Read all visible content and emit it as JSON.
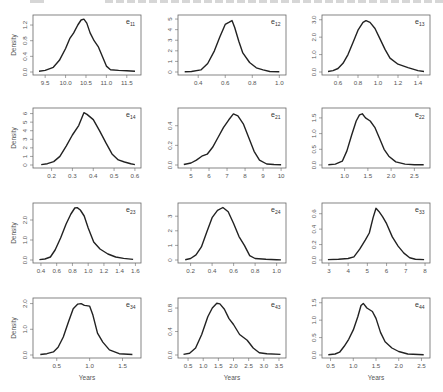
{
  "header": {
    "text_left": "",
    "text_right": ""
  },
  "chart_data": [
    {
      "id": "e11",
      "type": "line",
      "title": "e11",
      "subscript": "11",
      "xlabel": "",
      "ylabel": "Density",
      "xlim": [
        9.3,
        11.75
      ],
      "ylim": [
        0,
        1.38
      ],
      "xticks": [
        9.5,
        10.0,
        10.5,
        11.0,
        11.5
      ],
      "xtick_labels": [
        "9.5",
        "10.0",
        "10.5",
        "11.0",
        "11.5"
      ],
      "yticks": [
        0,
        0.4,
        0.8,
        1.2
      ],
      "ytick_labels": [
        "0.0",
        "0.4",
        "0.8",
        "1.2"
      ],
      "x": [
        9.35,
        9.5,
        9.7,
        9.85,
        10.0,
        10.1,
        10.2,
        10.3,
        10.38,
        10.45,
        10.52,
        10.6,
        10.7,
        10.8,
        10.9,
        11.0,
        11.1,
        11.3,
        11.5,
        11.7
      ],
      "y": [
        0.02,
        0.04,
        0.12,
        0.3,
        0.6,
        0.85,
        1.0,
        1.2,
        1.33,
        1.35,
        1.25,
        1.0,
        0.8,
        0.65,
        0.4,
        0.15,
        0.06,
        0.04,
        0.03,
        0.02
      ]
    },
    {
      "id": "e12",
      "type": "line",
      "title": "e12",
      "subscript": "12",
      "xlabel": "",
      "ylabel": "",
      "xlim": [
        0.28,
        1.02
      ],
      "ylim": [
        0,
        5.1
      ],
      "xticks": [
        0.4,
        0.6,
        0.8,
        1.0
      ],
      "xtick_labels": [
        "0.4",
        "0.6",
        "0.8",
        "1.0"
      ],
      "yticks": [
        0,
        1,
        2,
        3,
        4,
        5
      ],
      "ytick_labels": [
        "0",
        "1",
        "2",
        "3",
        "4",
        "5"
      ],
      "x": [
        0.3,
        0.35,
        0.42,
        0.47,
        0.52,
        0.56,
        0.6,
        0.63,
        0.65,
        0.67,
        0.7,
        0.73,
        0.78,
        0.83,
        0.88,
        0.93,
        1.0
      ],
      "y": [
        0.02,
        0.05,
        0.2,
        0.8,
        2.0,
        3.3,
        4.5,
        4.7,
        4.85,
        4.2,
        2.9,
        1.8,
        0.9,
        0.4,
        0.2,
        0.05,
        0.02
      ]
    },
    {
      "id": "e13",
      "type": "line",
      "title": "e13",
      "subscript": "13",
      "xlabel": "",
      "ylabel": "",
      "xlim": [
        0.48,
        1.48
      ],
      "ylim": [
        0,
        3.1
      ],
      "xticks": [
        0.6,
        0.8,
        1.0,
        1.2,
        1.4
      ],
      "xtick_labels": [
        "0.6",
        "0.8",
        "1.0",
        "1.2",
        "1.4"
      ],
      "yticks": [
        0,
        1,
        2,
        3
      ],
      "ytick_labels": [
        "0.0",
        "1.0",
        "2.0",
        "3.0"
      ],
      "x": [
        0.5,
        0.55,
        0.6,
        0.65,
        0.7,
        0.75,
        0.8,
        0.85,
        0.88,
        0.92,
        0.97,
        1.02,
        1.07,
        1.12,
        1.2,
        1.3,
        1.4,
        1.46
      ],
      "y": [
        0.03,
        0.08,
        0.2,
        0.5,
        1.0,
        1.7,
        2.4,
        2.85,
        2.95,
        2.85,
        2.5,
        1.9,
        1.3,
        0.8,
        0.45,
        0.25,
        0.08,
        0.03
      ]
    },
    {
      "id": "e14",
      "type": "line",
      "title": "e14",
      "subscript": "14",
      "xlabel": "",
      "ylabel": "Density",
      "xlim": [
        0.13,
        0.61
      ],
      "ylim": [
        0,
        6.3
      ],
      "xticks": [
        0.2,
        0.3,
        0.4,
        0.5,
        0.6
      ],
      "xtick_labels": [
        "0.2",
        "0.3",
        "0.4",
        "0.5",
        "0.6"
      ],
      "yticks": [
        0,
        1,
        2,
        3,
        4,
        5,
        6
      ],
      "ytick_labels": [
        "0",
        "1",
        "2",
        "3",
        "4",
        "5",
        "6"
      ],
      "x": [
        0.15,
        0.18,
        0.21,
        0.24,
        0.27,
        0.3,
        0.33,
        0.355,
        0.37,
        0.4,
        0.43,
        0.46,
        0.49,
        0.52,
        0.55,
        0.58,
        0.6
      ],
      "y": [
        0.05,
        0.15,
        0.4,
        1.0,
        2.2,
        3.5,
        4.6,
        6.1,
        5.9,
        5.3,
        4.0,
        2.6,
        1.3,
        0.6,
        0.35,
        0.15,
        0.05
      ]
    },
    {
      "id": "e21",
      "type": "line",
      "title": "e21",
      "subscript": "21",
      "xlabel": "",
      "ylabel": "",
      "xlim": [
        4.5,
        10.05
      ],
      "ylim": [
        0,
        0.55
      ],
      "xticks": [
        5,
        6,
        7,
        8,
        9,
        10
      ],
      "xtick_labels": [
        "5",
        "6",
        "7",
        "8",
        "9",
        "10"
      ],
      "yticks": [
        0,
        0.2,
        0.4
      ],
      "ytick_labels": [
        "0.0",
        "0.2",
        "0.4"
      ],
      "x": [
        4.6,
        5.0,
        5.3,
        5.6,
        5.9,
        6.2,
        6.5,
        6.8,
        7.1,
        7.35,
        7.6,
        7.9,
        8.2,
        8.5,
        8.8,
        9.2,
        9.6,
        10.0
      ],
      "y": [
        0.005,
        0.02,
        0.05,
        0.09,
        0.11,
        0.18,
        0.28,
        0.38,
        0.46,
        0.52,
        0.5,
        0.42,
        0.28,
        0.14,
        0.05,
        0.01,
        0.005,
        0.003
      ]
    },
    {
      "id": "e22",
      "type": "line",
      "title": "e22",
      "subscript": "22",
      "xlabel": "",
      "ylabel": "",
      "xlim": [
        0.6,
        2.75
      ],
      "ylim": [
        0,
        1.72
      ],
      "xticks": [
        1.0,
        1.5,
        2.0,
        2.5
      ],
      "xtick_labels": [
        "1.0",
        "1.5",
        "2.0",
        "2.5"
      ],
      "yticks": [
        0,
        0.5,
        1.0,
        1.5
      ],
      "ytick_labels": [
        "0.0",
        "0.5",
        "1.0",
        "1.5"
      ],
      "x": [
        0.65,
        0.8,
        0.95,
        1.05,
        1.15,
        1.25,
        1.32,
        1.38,
        1.45,
        1.55,
        1.65,
        1.75,
        1.85,
        1.95,
        2.1,
        2.3,
        2.5,
        2.7
      ],
      "y": [
        0.01,
        0.03,
        0.12,
        0.45,
        0.95,
        1.4,
        1.6,
        1.63,
        1.5,
        1.4,
        1.2,
        0.85,
        0.5,
        0.28,
        0.1,
        0.03,
        0.01,
        0.01
      ]
    },
    {
      "id": "e23",
      "type": "line",
      "title": "e23",
      "subscript": "23",
      "xlabel": "",
      "ylabel": "Density",
      "xlim": [
        0.35,
        1.62
      ],
      "ylim": [
        0,
        2.7
      ],
      "xticks": [
        0.4,
        0.6,
        0.8,
        1.0,
        1.2,
        1.4,
        1.6
      ],
      "xtick_labels": [
        "0.4",
        "0.6",
        "0.8",
        "1.0",
        "1.2",
        "1.4",
        "1.6"
      ],
      "yticks": [
        0,
        1,
        2
      ],
      "ytick_labels": [
        "0.0",
        "1.0",
        "2.0"
      ],
      "x": [
        0.38,
        0.45,
        0.52,
        0.58,
        0.65,
        0.72,
        0.78,
        0.83,
        0.86,
        0.9,
        0.95,
        1.0,
        1.07,
        1.15,
        1.25,
        1.35,
        1.45,
        1.57
      ],
      "y": [
        0.02,
        0.05,
        0.15,
        0.5,
        1.1,
        1.8,
        2.3,
        2.6,
        2.62,
        2.5,
        2.2,
        1.6,
        0.9,
        0.55,
        0.3,
        0.15,
        0.08,
        0.03
      ]
    },
    {
      "id": "e24",
      "type": "line",
      "title": "e24",
      "subscript": "24",
      "xlabel": "",
      "ylabel": "",
      "xlim": [
        0.12,
        1.05
      ],
      "ylim": [
        0,
        3.7
      ],
      "xticks": [
        0.2,
        0.4,
        0.6,
        0.8,
        1.0
      ],
      "xtick_labels": [
        "0.2",
        "0.4",
        "0.6",
        "0.8",
        "1.0"
      ],
      "yticks": [
        0,
        1,
        2,
        3
      ],
      "ytick_labels": [
        "0",
        "1",
        "2",
        "3"
      ],
      "x": [
        0.15,
        0.2,
        0.25,
        0.3,
        0.35,
        0.4,
        0.45,
        0.5,
        0.55,
        0.6,
        0.65,
        0.7,
        0.75,
        0.8,
        0.9,
        1.0,
        1.04
      ],
      "y": [
        0.02,
        0.1,
        0.35,
        0.9,
        1.9,
        2.9,
        3.4,
        3.6,
        3.3,
        2.5,
        1.6,
        1.0,
        0.3,
        0.1,
        0.05,
        0.02,
        0.01
      ]
    },
    {
      "id": "e33",
      "type": "line",
      "title": "e33",
      "subscript": "33",
      "xlabel": "",
      "ylabel": "",
      "xlim": [
        2.85,
        8.05
      ],
      "ylim": [
        0,
        0.7
      ],
      "xticks": [
        3,
        4,
        5,
        6,
        7,
        8
      ],
      "xtick_labels": [
        "3",
        "4",
        "5",
        "6",
        "7",
        "8"
      ],
      "yticks": [
        0,
        0.2,
        0.4,
        0.6
      ],
      "ytick_labels": [
        "0.0",
        "0.2",
        "0.4",
        "0.6"
      ],
      "x": [
        2.95,
        3.5,
        4.0,
        4.3,
        4.6,
        4.9,
        5.1,
        5.3,
        5.45,
        5.6,
        5.8,
        6.0,
        6.3,
        6.6,
        6.9,
        7.2,
        7.5,
        7.95
      ],
      "y": [
        0.005,
        0.01,
        0.02,
        0.04,
        0.14,
        0.26,
        0.35,
        0.55,
        0.67,
        0.63,
        0.56,
        0.47,
        0.3,
        0.18,
        0.09,
        0.03,
        0.01,
        0.005
      ]
    },
    {
      "id": "e34",
      "type": "line",
      "title": "e34",
      "subscript": "34",
      "xlabel": "Years",
      "ylabel": "Density",
      "xlim": [
        0.2,
        1.72
      ],
      "ylim": [
        0,
        2.1
      ],
      "xticks": [
        0.5,
        1.0,
        1.5
      ],
      "xtick_labels": [
        "0.5",
        "1.0",
        "1.5"
      ],
      "yticks": [
        0,
        1,
        2
      ],
      "ytick_labels": [
        "0.0",
        "1.0",
        "2.0"
      ],
      "x": [
        0.25,
        0.35,
        0.45,
        0.52,
        0.6,
        0.68,
        0.75,
        0.82,
        0.87,
        0.92,
        0.95,
        1.0,
        1.05,
        1.12,
        1.2,
        1.3,
        1.45,
        1.65
      ],
      "y": [
        0.02,
        0.05,
        0.12,
        0.3,
        0.7,
        1.3,
        1.8,
        1.98,
        2.0,
        1.93,
        1.92,
        1.9,
        1.55,
        0.85,
        0.5,
        0.2,
        0.05,
        0.02
      ]
    },
    {
      "id": "e43",
      "type": "line",
      "title": "e43",
      "subscript": "43",
      "xlabel": "Years",
      "ylabel": "",
      "xlim": [
        0.3,
        3.6
      ],
      "ylim": [
        0,
        0.92
      ],
      "xticks": [
        0.5,
        1.0,
        1.5,
        2.0,
        2.5,
        3.0,
        3.5
      ],
      "xtick_labels": [
        "0.5",
        "1.0",
        "1.5",
        "2.0",
        "2.5",
        "3.0",
        "3.5"
      ],
      "yticks": [
        0,
        0.4,
        0.8
      ],
      "ytick_labels": [
        "0.0",
        "0.4",
        "0.8"
      ],
      "x": [
        0.35,
        0.55,
        0.75,
        0.95,
        1.15,
        1.3,
        1.45,
        1.55,
        1.7,
        1.85,
        2.0,
        2.2,
        2.45,
        2.65,
        2.85,
        3.1,
        3.55
      ],
      "y": [
        0.01,
        0.03,
        0.12,
        0.35,
        0.65,
        0.8,
        0.88,
        0.87,
        0.78,
        0.62,
        0.52,
        0.35,
        0.25,
        0.12,
        0.04,
        0.02,
        0.01
      ]
    },
    {
      "id": "e44",
      "type": "line",
      "title": "e44",
      "subscript": "44",
      "xlabel": "Years",
      "ylabel": "",
      "xlim": [
        0.4,
        2.6
      ],
      "ylim": [
        0,
        1.55
      ],
      "xticks": [
        0.5,
        1.0,
        1.5,
        2.0,
        2.5
      ],
      "xtick_labels": [
        "0.5",
        "1.0",
        "1.5",
        "2.0",
        "2.5"
      ],
      "yticks": [
        0,
        0.5,
        1.0,
        1.5
      ],
      "ytick_labels": [
        "0.0",
        "0.5",
        "1.0",
        "1.5"
      ],
      "x": [
        0.45,
        0.6,
        0.7,
        0.8,
        0.9,
        1.0,
        1.1,
        1.17,
        1.22,
        1.3,
        1.42,
        1.5,
        1.6,
        1.7,
        1.85,
        2.0,
        2.2,
        2.55
      ],
      "y": [
        0.01,
        0.03,
        0.08,
        0.25,
        0.45,
        0.72,
        1.1,
        1.42,
        1.48,
        1.35,
        1.25,
        1.05,
        0.65,
        0.38,
        0.2,
        0.1,
        0.03,
        0.01
      ]
    }
  ]
}
